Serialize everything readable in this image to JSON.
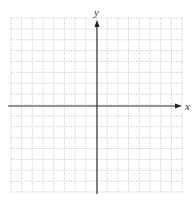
{
  "graph": {
    "x_axis_label": "x",
    "y_axis_label": "y",
    "grid": {
      "columns": 16,
      "rows": 16,
      "left": 11,
      "top": 18,
      "right": 182,
      "bottom": 192,
      "line_style": "dotted",
      "line_color": "#b8b8b8"
    },
    "axes": {
      "origin_x": 97,
      "origin_y": 106,
      "color": "#333333",
      "x_arrow_end": 182,
      "y_arrow_end": 20
    }
  },
  "chart_data": {
    "type": "scatter",
    "title": "",
    "xlabel": "x",
    "ylabel": "y",
    "x": [],
    "y": [],
    "xlim": [
      -8,
      8
    ],
    "ylim": [
      -8,
      8
    ],
    "grid": true,
    "legend": null
  }
}
